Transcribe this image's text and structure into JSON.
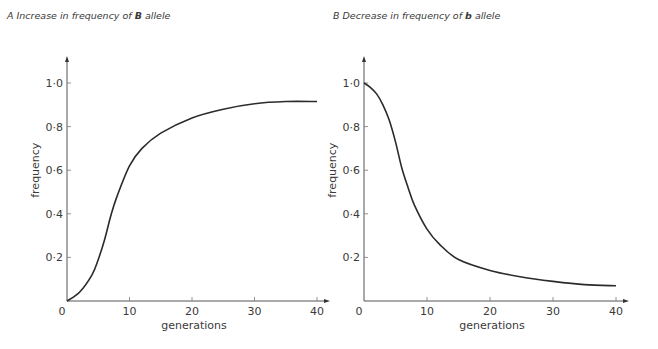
{
  "chart_data": [
    {
      "type": "line",
      "panel": "A",
      "title_prefix": "A Increase in frequency of ",
      "title_bold": "B",
      "title_suffix": " allele",
      "xlabel": "generations",
      "ylabel": "frequency",
      "xlim": [
        0,
        40
      ],
      "ylim": [
        0,
        1.0
      ],
      "x_ticks": [
        "0",
        "10",
        "20",
        "30",
        "40"
      ],
      "y_ticks": [
        "0·2",
        "0·4",
        "0·6",
        "0·8",
        "1·0"
      ],
      "grid": false,
      "series": [
        {
          "name": "B allele frequency",
          "x": [
            0,
            2,
            4,
            5,
            6,
            7,
            8,
            10,
            12,
            15,
            20,
            25,
            30,
            35,
            40
          ],
          "values": [
            0.0,
            0.04,
            0.12,
            0.19,
            0.28,
            0.39,
            0.48,
            0.62,
            0.7,
            0.77,
            0.84,
            0.88,
            0.905,
            0.915,
            0.915
          ]
        }
      ]
    },
    {
      "type": "line",
      "panel": "B",
      "title_prefix": "B Decrease in frequency of ",
      "title_bold": "b",
      "title_suffix": " allele",
      "xlabel": "generations",
      "ylabel": "frequency",
      "xlim": [
        0,
        40
      ],
      "ylim": [
        0,
        1.0
      ],
      "x_ticks": [
        "0",
        "10",
        "20",
        "30",
        "40"
      ],
      "y_ticks": [
        "0·2",
        "0·4",
        "0·6",
        "0·8",
        "1·0"
      ],
      "grid": false,
      "series": [
        {
          "name": "b allele frequency",
          "x": [
            0,
            1,
            2,
            3,
            4,
            5,
            6,
            7,
            8,
            10,
            12,
            15,
            20,
            25,
            30,
            35,
            40
          ],
          "values": [
            1.0,
            0.98,
            0.95,
            0.9,
            0.83,
            0.73,
            0.61,
            0.52,
            0.44,
            0.33,
            0.26,
            0.19,
            0.14,
            0.11,
            0.09,
            0.075,
            0.07
          ]
        }
      ]
    }
  ]
}
